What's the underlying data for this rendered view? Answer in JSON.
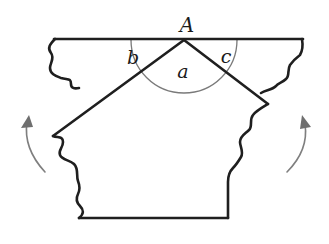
{
  "figure": {
    "type": "geometry-diagram",
    "labels": {
      "vertex": "A",
      "angle_middle": "a",
      "angle_left": "b",
      "angle_right": "c"
    },
    "arrows": [
      {
        "side": "left",
        "direction": "up"
      },
      {
        "side": "right",
        "direction": "up"
      }
    ],
    "colors": {
      "outline": "#1f1f1f",
      "arc": "#7a7a7a",
      "arrow": "#7f7f7f",
      "background": "#ffffff"
    }
  }
}
